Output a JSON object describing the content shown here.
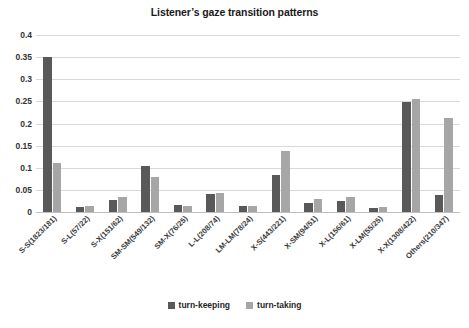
{
  "chart_data": {
    "type": "bar",
    "title": "Listener’s gaze transition patterns",
    "xlabel": "",
    "ylabel": "",
    "ylim": [
      0,
      0.4
    ],
    "yticks": [
      "0",
      "0.05",
      "0.1",
      "0.15",
      "0.2",
      "0.25",
      "0.3",
      "0.35",
      "0.4"
    ],
    "ytick_values": [
      0,
      0.05,
      0.1,
      0.15,
      0.2,
      0.25,
      0.3,
      0.35,
      0.4
    ],
    "grid": true,
    "legend_position": "bottom",
    "categories": [
      "S-S(1823/181)",
      "S-L(57/22)",
      "S-X(151/62)",
      "SM-SM(549/132)",
      "SM-X(76/25)",
      "L-L(208/74)",
      "LM-LM(78/24)",
      "X-S(443/221)",
      "X-SM(94/51)",
      "X-L(156/61)",
      "X-LM(55/25)",
      "X-X(1308/422)",
      "Others(210/347)"
    ],
    "series": [
      {
        "name": "turn-keeping",
        "color": "#595959",
        "values": [
          0.35,
          0.012,
          0.027,
          0.104,
          0.015,
          0.04,
          0.013,
          0.083,
          0.021,
          0.024,
          0.01,
          0.249,
          0.038
        ]
      },
      {
        "name": "turn-taking",
        "color": "#a6a6a6",
        "values": [
          0.11,
          0.014,
          0.035,
          0.079,
          0.013,
          0.043,
          0.013,
          0.137,
          0.03,
          0.033,
          0.012,
          0.256,
          0.212
        ]
      }
    ]
  }
}
